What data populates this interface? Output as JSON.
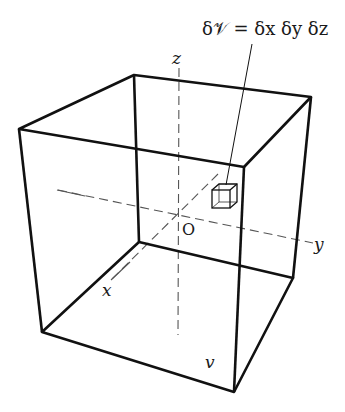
{
  "diagram": {
    "equation": "δ𝒱 = δx δy δz",
    "labels": {
      "z_axis": "z",
      "y_axis": "y",
      "x_axis": "x",
      "origin": "O",
      "region": "v"
    },
    "colors": {
      "edge": "#111111",
      "dashed": "#555555",
      "background": "#ffffff"
    }
  }
}
